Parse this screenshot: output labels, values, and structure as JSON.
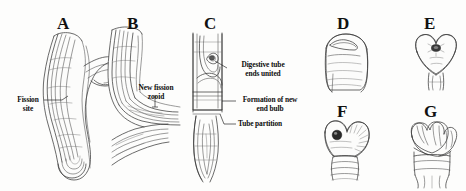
{
  "figure": {
    "type": "scientific-line-drawing",
    "background_color": "#fdfdfc",
    "ink_color": "#2b2b2b",
    "panels": [
      {
        "id": "A",
        "label": "A",
        "x": 57,
        "y": 15,
        "description": "Elongated zooid body bent sigmoidally with lateral fission protrusion"
      },
      {
        "id": "B",
        "label": "B",
        "x": 127,
        "y": 15,
        "description": "Branching body with new fission zooid separating at an angle"
      },
      {
        "id": "C",
        "label": "C",
        "x": 204,
        "y": 15,
        "description": "Vertical tube showing digestive tube ends united and tube partition"
      },
      {
        "id": "D",
        "label": "D",
        "x": 337,
        "y": 15,
        "description": "Rounded anterior end bulb with transverse slit"
      },
      {
        "id": "E",
        "label": "E",
        "x": 424,
        "y": 15,
        "description": "Heart-shaped bilobed end bulb with dark central mouth"
      },
      {
        "id": "F",
        "label": "F",
        "x": 337,
        "y": 103,
        "description": "Bilobed bulb with dark ocellus and radiating striations over segmented trunk"
      },
      {
        "id": "G",
        "label": "G",
        "x": 424,
        "y": 103,
        "description": "Crown of emerging tentacles on the regenerated end bulb"
      }
    ],
    "annotations": [
      {
        "id": "fission-site",
        "lines": [
          "Fission",
          "site"
        ],
        "x": 12,
        "y": 96,
        "align": "center",
        "panel": "A"
      },
      {
        "id": "new-fission-zooid",
        "lines": [
          "New fission",
          "zooid"
        ],
        "x": 135,
        "y": 85,
        "align": "center",
        "panel": "B"
      },
      {
        "id": "digestive-tube",
        "lines": [
          "Digestive tube",
          "ends united"
        ],
        "x": 228,
        "y": 62,
        "align": "center",
        "panel": "C"
      },
      {
        "id": "formation-end-bulb",
        "lines": [
          "Formation of new",
          "end bulb"
        ],
        "x": 228,
        "y": 98,
        "align": "center",
        "panel": "C"
      },
      {
        "id": "tube-partition",
        "lines": [
          "Tube partition"
        ],
        "x": 228,
        "y": 127,
        "align": "left",
        "panel": "C"
      }
    ]
  }
}
